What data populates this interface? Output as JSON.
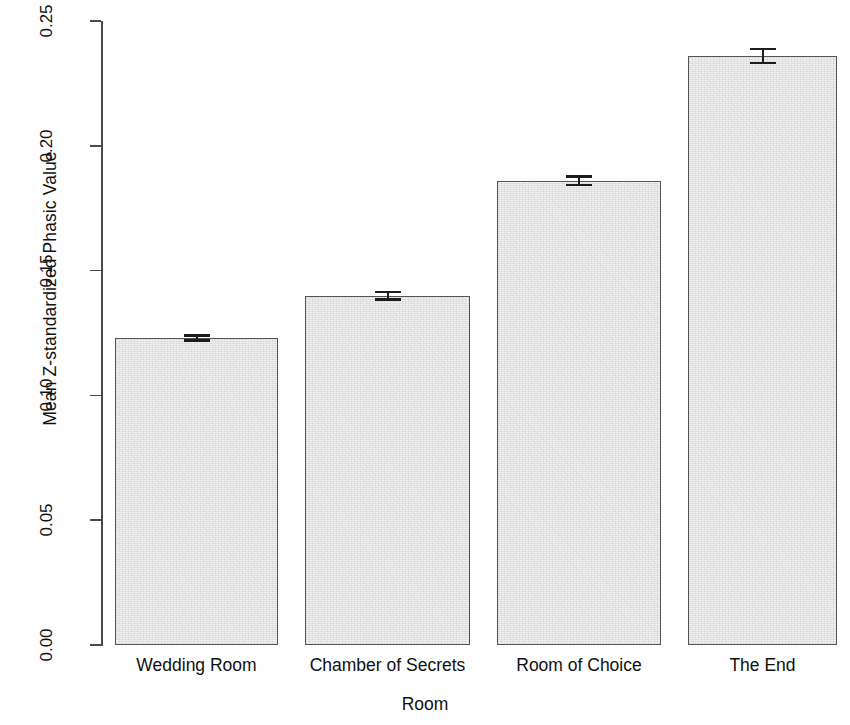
{
  "chart_data": {
    "type": "bar",
    "title": "",
    "xlabel": "Room",
    "ylabel": "Mean Z-standardized Phasic Value",
    "categories": [
      "Wedding Room",
      "Chamber of Secrets",
      "Room of Choice",
      "The End"
    ],
    "values": [
      0.123,
      0.14,
      0.186,
      0.236
    ],
    "errors": [
      0.001,
      0.0015,
      0.0017,
      0.0028
    ],
    "ylim": [
      0.0,
      0.25
    ],
    "yticks": [
      "0.00",
      "0.05",
      "0.10",
      "0.15",
      "0.20",
      "0.25"
    ],
    "ytick_values": [
      0.0,
      0.05,
      0.1,
      0.15,
      0.2,
      0.25
    ],
    "grid": false,
    "legend": false,
    "bar_fill_color": "#f2f2f2",
    "bar_border_color": "#555555",
    "error_bar_color": "#1c1c1c",
    "background_color": "#ffffff"
  }
}
